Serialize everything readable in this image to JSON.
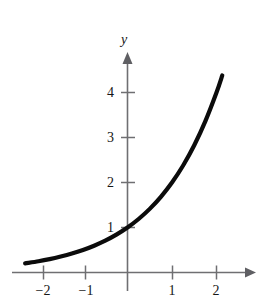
{
  "chart_data": {
    "type": "line",
    "title": "",
    "subtitle": "",
    "xlabel": "",
    "ylabel": "y",
    "function": "y = 2^x",
    "xlim": [
      -2.3,
      2.75
    ],
    "ylim": [
      -0.35,
      4.85
    ],
    "grid": false,
    "legend": null,
    "annotations": [],
    "x_ticks": [
      -2,
      -1,
      1,
      2
    ],
    "x_tick_labels": [
      "−2",
      "−1",
      "1",
      "2"
    ],
    "y_ticks": [
      1,
      2,
      3,
      4
    ],
    "y_tick_labels": [
      "1",
      "2",
      "3",
      "4"
    ],
    "series": [
      {
        "name": "y = 2^x",
        "color": "#0b0b0b",
        "x": [
          -2.3,
          -2.0,
          -1.75,
          -1.5,
          -1.25,
          -1.0,
          -0.75,
          -0.5,
          -0.25,
          0.0,
          0.25,
          0.5,
          0.75,
          1.0,
          1.25,
          1.5,
          1.75,
          2.0,
          2.13
        ],
        "y": [
          0.203,
          0.25,
          0.297,
          0.354,
          0.42,
          0.5,
          0.595,
          0.707,
          0.841,
          1.0,
          1.189,
          1.414,
          1.682,
          2.0,
          2.378,
          2.828,
          3.364,
          4.0,
          4.38
        ]
      }
    ]
  },
  "axes": {
    "y_axis_label": "y",
    "x_axis_arrow": "arrow-right",
    "y_axis_arrow": "arrow-up",
    "axis_color": "#6f6f72",
    "curve_color": "#0b0b0b",
    "background_color": "#ffffff"
  }
}
